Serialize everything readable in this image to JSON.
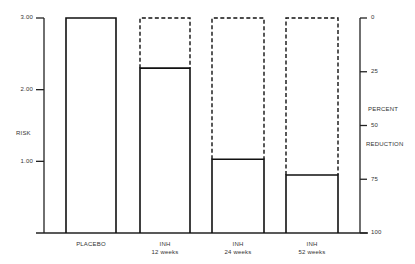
{
  "chart_data": {
    "type": "bar",
    "title": "",
    "categories": [
      "PLACEBO",
      "INH 12 weeks",
      "INH 24 weeks",
      "INH 52 weeks"
    ],
    "category_lines": [
      [
        "PLACEBO"
      ],
      [
        "INH",
        "12 weeks"
      ],
      [
        "INH",
        "24 weeks"
      ],
      [
        "INH",
        "52 weeks"
      ]
    ],
    "series": [
      {
        "name": "Risk",
        "values": [
          3.0,
          2.3,
          1.03,
          0.81
        ]
      },
      {
        "name": "Placebo reference (dashed)",
        "values": [
          3.0,
          3.0,
          3.0,
          3.0
        ]
      }
    ],
    "ylabel": "RISK",
    "ylim": [
      0,
      3
    ],
    "yticks": [
      "3.00",
      "2.00",
      "1.00"
    ],
    "y2label_lines": [
      "PERCENT",
      "REDUCTION"
    ],
    "y2lim": [
      100,
      0
    ],
    "y2ticks": [
      "0",
      "25",
      "50",
      "75",
      "100"
    ],
    "grid": false,
    "legend": "none"
  },
  "axis": {
    "left_label": "RISK",
    "left_ticks": [
      {
        "label": "3.00",
        "value": 3
      },
      {
        "label": "2.00",
        "value": 2
      },
      {
        "label": "1.00",
        "value": 1
      }
    ],
    "right_label_1": "PERCENT",
    "right_label_2": "REDUCTION",
    "right_ticks": [
      {
        "label": "0",
        "value": 0
      },
      {
        "label": "25",
        "value": 25
      },
      {
        "label": "50",
        "value": 50
      },
      {
        "label": "75",
        "value": 75
      },
      {
        "label": "100",
        "value": 100
      }
    ]
  },
  "categories": [
    {
      "line1": "PLACEBO",
      "line2": ""
    },
    {
      "line1": "INH",
      "line2": "12 weeks"
    },
    {
      "line1": "INH",
      "line2": "24 weeks"
    },
    {
      "line1": "INH",
      "line2": "52 weeks"
    }
  ]
}
